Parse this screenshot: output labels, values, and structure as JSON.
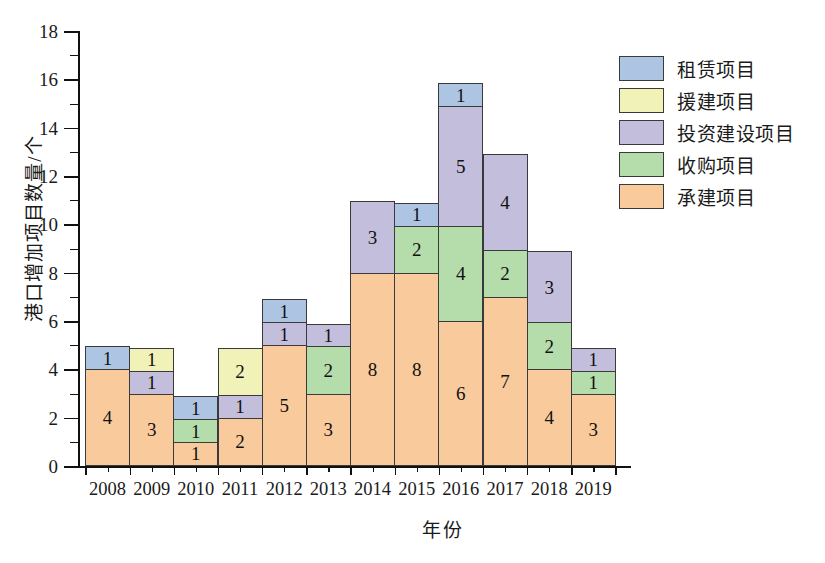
{
  "chart_data": {
    "type": "bar",
    "subtype": "stacked-bar",
    "title": "",
    "xlabel": "年份",
    "ylabel": "港口增加项目数量/个",
    "ylim": [
      0,
      18
    ],
    "ytick_step": 2,
    "yticks": [
      0,
      2,
      4,
      6,
      8,
      10,
      12,
      14,
      16,
      18
    ],
    "ytick_labels": [
      "0",
      "2",
      "4",
      "6",
      "8",
      "10",
      "12",
      "14",
      "16",
      "18"
    ],
    "grid": false,
    "legend_position": "upper-right",
    "categories": [
      "2008",
      "2009",
      "2010",
      "2011",
      "2012",
      "2013",
      "2014",
      "2015",
      "2016",
      "2017",
      "2018",
      "2019"
    ],
    "stack_order_bottom_to_top": [
      "承建项目",
      "收购项目",
      "投资建设项目",
      "援建项目",
      "租赁项目"
    ],
    "series": [
      {
        "name": "承建项目",
        "color": "#f9cb9c",
        "values": [
          4,
          3,
          1,
          2,
          5,
          3,
          8,
          8,
          6,
          7,
          4,
          3
        ]
      },
      {
        "name": "收购项目",
        "color": "#b5dcab",
        "values": [
          0,
          0,
          1,
          0,
          0,
          2,
          0,
          2,
          4,
          2,
          2,
          1
        ]
      },
      {
        "name": "投资建设项目",
        "color": "#c3bedb",
        "values": [
          0,
          1,
          0,
          1,
          1,
          1,
          3,
          0,
          5,
          4,
          3,
          1
        ]
      },
      {
        "name": "援建项目",
        "color": "#f0f2b8",
        "values": [
          0,
          1,
          0,
          2,
          0,
          0,
          0,
          0,
          0,
          0,
          0,
          0
        ]
      },
      {
        "name": "租赁项目",
        "color": "#aec4e3",
        "values": [
          1,
          0,
          1,
          0,
          1,
          0,
          0,
          1,
          1,
          0,
          0,
          0
        ]
      }
    ],
    "totals": [
      5,
      5,
      3,
      5,
      7,
      6,
      11,
      11,
      16,
      13,
      9,
      5
    ]
  },
  "legend": {
    "items": [
      {
        "label": "租赁项目",
        "color": "#aec4e3"
      },
      {
        "label": "援建项目",
        "color": "#f0f2b8"
      },
      {
        "label": "投资建设项目",
        "color": "#c3bedb"
      },
      {
        "label": "收购项目",
        "color": "#b5dcab"
      },
      {
        "label": "承建项目",
        "color": "#f9cb9c"
      }
    ]
  },
  "axes": {
    "y_title": "港口增加项目数量/个",
    "x_title": "年份"
  }
}
